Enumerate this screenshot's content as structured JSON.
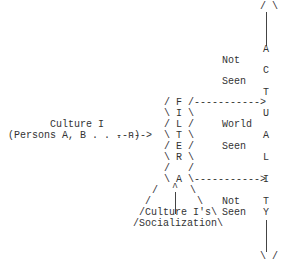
{
  "diagram": {
    "source": {
      "title": "Culture I",
      "subtitle": "(Persons A, B . . . n)",
      "arrow": "----->"
    },
    "filter": {
      "letters": [
        "F",
        "I",
        "L",
        "T",
        "E",
        "R",
        "A"
      ],
      "row_f": "/ F /",
      "row_i": "\\ I \\",
      "row_l": "/ L /",
      "row_t": "\\ T \\",
      "row_e": "/ E /",
      "row_r": "\\ R \\",
      "row_blank": "/   /",
      "row_a": "\\ A \\",
      "caret": "^",
      "upper_arrow": "----------->",
      "lower_arrow": "----------->"
    },
    "base": {
      "label_line1": "/Culture I's\\",
      "label_line2": "/Socialization\\"
    },
    "middle_labels": {
      "top": [
        "Not",
        "Seen"
      ],
      "middle": [
        "World",
        "Seen"
      ],
      "bottom": [
        "Not",
        "Seen"
      ]
    },
    "actuality": {
      "word": "ACTUALITY",
      "letters": [
        "A",
        "C",
        "T",
        "U",
        "A",
        "L",
        "I",
        "T",
        "Y"
      ],
      "top_arrowhead": "/ \\",
      "bottom_arrowhead": "\\ /"
    }
  }
}
